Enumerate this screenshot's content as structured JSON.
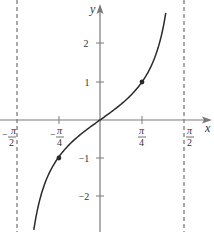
{
  "chart_data": {
    "type": "line",
    "title": "",
    "function": "y = tan x",
    "xlabel": "x",
    "ylabel": "y",
    "x_ticks": [
      {
        "value": -0.7854,
        "label_num": "π",
        "label_den": "4",
        "sign": "−"
      },
      {
        "value": 0.7854,
        "label_num": "π",
        "label_den": "4",
        "sign": ""
      }
    ],
    "asymptote_labels": [
      {
        "value": -1.5708,
        "label_num": "π",
        "label_den": "2",
        "sign": "−"
      },
      {
        "value": 1.5708,
        "label_num": "π",
        "label_den": "2",
        "sign": ""
      }
    ],
    "y_ticks": [
      {
        "value": 2,
        "label": "2"
      },
      {
        "value": 1,
        "label": "1"
      },
      {
        "value": -1,
        "label": "−1"
      },
      {
        "value": -2,
        "label": "−2"
      }
    ],
    "asymptotes": [
      -1.5708,
      1.5708
    ],
    "marked_points": [
      {
        "x": -0.7854,
        "y": -1
      },
      {
        "x": 0.7854,
        "y": 1
      }
    ],
    "x": [
      -1.238,
      -1.1,
      -1.0,
      -0.7854,
      -0.5,
      -0.25,
      0,
      0.25,
      0.5,
      0.7854,
      1.0,
      1.1,
      1.23
    ],
    "values": [
      -2.895,
      -1.965,
      -1.557,
      -1,
      -0.546,
      -0.255,
      0,
      0.255,
      0.546,
      1,
      1.557,
      1.965,
      2.816
    ],
    "xlim": [
      -1.87,
      2.12
    ],
    "ylim": [
      -2.95,
      3.15
    ],
    "grid": false,
    "legend": "none"
  },
  "style": {
    "axis_color": "#7a7a7a",
    "curve_color": "#2a2a2a",
    "asymptote_color": "#555555"
  }
}
